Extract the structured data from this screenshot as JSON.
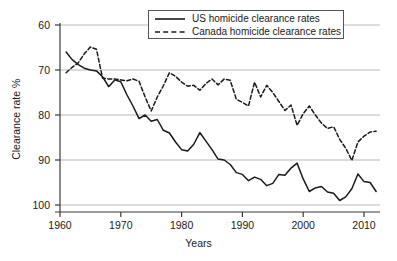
{
  "chart_data": {
    "type": "line",
    "title": "",
    "xlabel": "Years",
    "ylabel": "Clearance rate %",
    "xlim": [
      1958,
      2013
    ],
    "ylim": [
      59,
      101
    ],
    "xticks": [
      1960,
      1970,
      1980,
      1990,
      2000,
      2010
    ],
    "yticks": [
      60,
      70,
      80,
      90,
      100
    ],
    "grid": "horizontal",
    "legend_position": "top-center",
    "series": [
      {
        "name": "US homicide clearance rates",
        "style": "solid",
        "color": "#1a1a1a",
        "x": [
          1961,
          1962,
          1963,
          1964,
          1965,
          1966,
          1967,
          1968,
          1969,
          1970,
          1971,
          1972,
          1973,
          1974,
          1975,
          1976,
          1977,
          1978,
          1979,
          1980,
          1981,
          1982,
          1983,
          1984,
          1985,
          1986,
          1987,
          1988,
          1989,
          1990,
          1991,
          1992,
          1993,
          1994,
          1995,
          1996,
          1997,
          1998,
          1999,
          2000,
          2001,
          2002,
          2003,
          2004,
          2005,
          2006,
          2007,
          2008,
          2009,
          2010,
          2011,
          2012
        ],
        "values": [
          94.0,
          92.3,
          91.2,
          90.4,
          90.0,
          89.8,
          88.5,
          86.3,
          87.8,
          87.4,
          84.5,
          82.0,
          79.2,
          80.0,
          78.6,
          79.0,
          76.6,
          76.0,
          74.0,
          72.3,
          72.0,
          73.5,
          76.1,
          74.2,
          72.3,
          70.2,
          70.0,
          69.0,
          67.2,
          66.8,
          65.4,
          66.2,
          65.7,
          64.3,
          64.8,
          66.8,
          66.6,
          68.2,
          69.3,
          65.8,
          63.0,
          63.8,
          64.1,
          62.9,
          62.6,
          61.0,
          61.8,
          63.6,
          66.9,
          65.2,
          65.0,
          63.0
        ]
      },
      {
        "name": "Canada homicide clearance rates",
        "style": "dashed",
        "color": "#1a1a1a",
        "x": [
          1961,
          1962,
          1963,
          1964,
          1965,
          1966,
          1967,
          1968,
          1969,
          1970,
          1971,
          1972,
          1973,
          1974,
          1975,
          1976,
          1977,
          1978,
          1979,
          1980,
          1981,
          1982,
          1983,
          1984,
          1985,
          1986,
          1987,
          1988,
          1989,
          1990,
          1991,
          1992,
          1993,
          1994,
          1995,
          1996,
          1997,
          1998,
          1999,
          2000,
          2001,
          2002,
          2003,
          2004,
          2005,
          2006,
          2007,
          2008,
          2009,
          2010,
          2011,
          2012
        ],
        "values": [
          89.4,
          90.6,
          91.6,
          93.6,
          95.1,
          94.6,
          88.2,
          88.0,
          88.0,
          87.8,
          87.6,
          88.0,
          87.5,
          84.0,
          80.9,
          84.0,
          86.5,
          89.4,
          88.6,
          87.3,
          86.4,
          86.6,
          85.5,
          87.0,
          88.0,
          86.7,
          88.0,
          87.7,
          83.5,
          82.8,
          82.0,
          87.3,
          84.0,
          86.6,
          85.0,
          83.0,
          81.0,
          82.2,
          77.7,
          80.3,
          82.0,
          80.0,
          78.2,
          77.0,
          77.4,
          74.6,
          72.6,
          69.9,
          74.0,
          75.3,
          76.2,
          76.4
        ]
      }
    ]
  },
  "axes": {
    "y_title": "Clearance rate %",
    "x_title": "Years",
    "y_tick_labels": [
      "100",
      "90",
      "80",
      "70",
      "60"
    ],
    "x_tick_labels": [
      "1960",
      "1970",
      "1980",
      "1990",
      "2000",
      "2010"
    ]
  },
  "legend": {
    "entries": [
      {
        "label": "US homicide clearance rates",
        "style": "solid"
      },
      {
        "label": "Canada homicide clearance rates",
        "style": "dashed"
      }
    ]
  },
  "colors": {
    "line": "#1a1a1a",
    "grid": "#b9b9b9",
    "axis": "#3a3a3a",
    "background": "#ffffff",
    "legend_border": "#555555"
  }
}
